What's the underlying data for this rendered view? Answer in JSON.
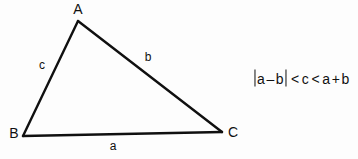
{
  "figure": {
    "background_color": "#fdfdfd",
    "stroke_color": "#101010",
    "triangle": {
      "vertices": [
        {
          "name": "A",
          "label": "A",
          "x": 78,
          "y": 21
        },
        {
          "name": "B",
          "label": "B",
          "x": 23,
          "y": 136
        },
        {
          "name": "C",
          "label": "C",
          "x": 222,
          "y": 132
        }
      ],
      "vertex_labels": [
        {
          "label": "A",
          "x": 78,
          "y": 9
        },
        {
          "label": "B",
          "x": 14,
          "y": 133
        },
        {
          "label": "C",
          "x": 233,
          "y": 132
        }
      ],
      "side_labels": [
        {
          "label": "a",
          "x": 113,
          "y": 146,
          "between": "B-C"
        },
        {
          "label": "b",
          "x": 148,
          "y": 57,
          "between": "A-C"
        },
        {
          "label": "c",
          "x": 42,
          "y": 65,
          "between": "A-B"
        }
      ]
    },
    "formula": {
      "full_text": "|a − b| < c < a + b",
      "left_abs_open": "|",
      "left_term_1": "a",
      "left_operator": "–",
      "left_term_2": "b",
      "left_abs_close": "|",
      "relation_1": "<",
      "middle_term": "c",
      "relation_2": "<",
      "right_term_1": "a",
      "right_operator": "+",
      "right_term_2": "b"
    }
  }
}
